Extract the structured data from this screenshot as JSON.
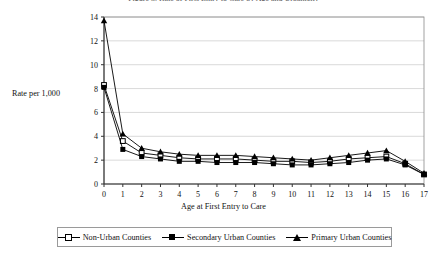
{
  "title_clipped": "Figure 3. Rate of First Entry to Care by Age and Urbanicity",
  "axis": {
    "ylabel": "Rate per 1,000",
    "xlabel": "Age at First Entry to Care"
  },
  "legend": {
    "entries": [
      {
        "label": "Non-Urban Counties",
        "marker": "open-square"
      },
      {
        "label": "Secondary Urban Counties",
        "marker": "filled-square"
      },
      {
        "label": "Primary Urban Counties",
        "marker": "filled-triangle"
      }
    ]
  },
  "chart_data": {
    "type": "line",
    "title": "Figure 3. Rate of First Entry to Care by Age and Urbanicity",
    "xlabel": "Age at First Entry to Care",
    "ylabel": "Rate per 1,000",
    "x": [
      0,
      1,
      2,
      3,
      4,
      5,
      6,
      7,
      8,
      9,
      10,
      11,
      12,
      13,
      14,
      15,
      16,
      17
    ],
    "xtick_labels": [
      "0",
      "1",
      "2",
      "3",
      "4",
      "5",
      "6",
      "7",
      "8",
      "9",
      "10",
      "11",
      "12",
      "13",
      "14",
      "15",
      "16",
      "17"
    ],
    "ytick_labels": [
      "0",
      "2",
      "4",
      "6",
      "8",
      "10",
      "12",
      "14"
    ],
    "yticks": [
      0,
      2,
      4,
      6,
      8,
      10,
      12,
      14
    ],
    "xlim": [
      0,
      17
    ],
    "ylim": [
      0,
      14
    ],
    "grid": "horizontal",
    "legend_position": "bottom",
    "series": [
      {
        "name": "Non-Urban Counties",
        "marker": "open-square",
        "color": "#000000",
        "values": [
          8.3,
          3.6,
          2.6,
          2.4,
          2.2,
          2.1,
          2.1,
          2.1,
          2.0,
          1.9,
          1.9,
          1.8,
          1.9,
          2.1,
          2.2,
          2.3,
          1.7,
          0.8
        ]
      },
      {
        "name": "Secondary Urban Counties",
        "marker": "filled-square",
        "color": "#000000",
        "values": [
          8.1,
          2.9,
          2.3,
          2.1,
          1.9,
          1.9,
          1.8,
          1.8,
          1.8,
          1.7,
          1.6,
          1.6,
          1.7,
          1.8,
          2.0,
          2.1,
          1.6,
          0.8
        ]
      },
      {
        "name": "Primary Urban Counties",
        "marker": "filled-triangle",
        "color": "#000000",
        "values": [
          13.7,
          4.2,
          3.0,
          2.7,
          2.5,
          2.4,
          2.4,
          2.4,
          2.3,
          2.2,
          2.1,
          2.0,
          2.2,
          2.4,
          2.6,
          2.8,
          1.9,
          0.9
        ]
      }
    ]
  },
  "style": {
    "axis_color": "#333333",
    "grid_color": "#c9c9c9",
    "frame_color": "#8a8a8a",
    "series_color": "#000000"
  }
}
